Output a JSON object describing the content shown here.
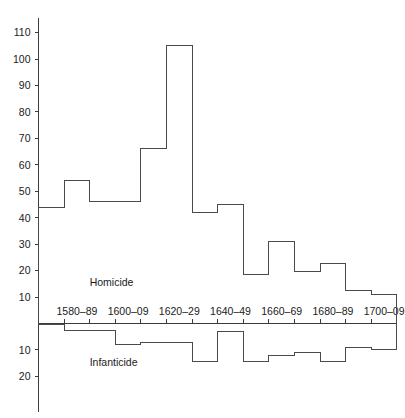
{
  "chart_data": {
    "type": "bar",
    "title": "",
    "subtitle": "",
    "xlabel": "",
    "ylabel": "",
    "orientation": "vertical-back-to-back-step-histogram",
    "grid": false,
    "legend_position": "inline-annotation",
    "categories": [
      "1570–79",
      "1580–89",
      "1590–99",
      "1600–09",
      "1610–19",
      "1620–29",
      "1630–39",
      "1640–49",
      "1650–59",
      "1660–69",
      "1670–79",
      "1680–89",
      "1690–99",
      "1700–09"
    ],
    "x_tick_labels": [
      "1580–89",
      "1600–09",
      "1620–29",
      "1640–49",
      "1660–69",
      "1680–89",
      "1700–09"
    ],
    "y_tick_labels_upper": [
      "110",
      "100",
      "90",
      "80",
      "70",
      "60",
      "50",
      "40",
      "30",
      "20",
      "10"
    ],
    "y_tick_values_upper": [
      110,
      100,
      90,
      80,
      70,
      60,
      50,
      40,
      30,
      20,
      10
    ],
    "y_tick_labels_lower": [
      "10",
      "20"
    ],
    "y_tick_values_lower": [
      10,
      20
    ],
    "ylim_upper": [
      0,
      112
    ],
    "ylim_lower": [
      0,
      24
    ],
    "series": [
      {
        "name": "Homicide",
        "direction": "up",
        "values": [
          44,
          54,
          46,
          46,
          66,
          105,
          42,
          45,
          18.5,
          31,
          19.5,
          22.5,
          12.5,
          11
        ]
      },
      {
        "name": "Infanticide",
        "direction": "down",
        "values": [
          0.5,
          2.5,
          2.5,
          8,
          7,
          7,
          14.5,
          3,
          14.5,
          12,
          11,
          14.5,
          9,
          10
        ]
      }
    ],
    "annotations": [
      {
        "text": "Homicide",
        "x_category": "1590–99",
        "y_value": 14
      },
      {
        "text": "Infanticide",
        "x_category": "1590–99",
        "y_value": -16
      }
    ]
  },
  "labels": {
    "homicide": "Homicide",
    "infanticide": "Infanticide"
  },
  "colors": {
    "background": "#ffffff",
    "axis": "#3b3b3b",
    "series_stroke": "#4a4a4a",
    "text": "#1a1a1a"
  }
}
